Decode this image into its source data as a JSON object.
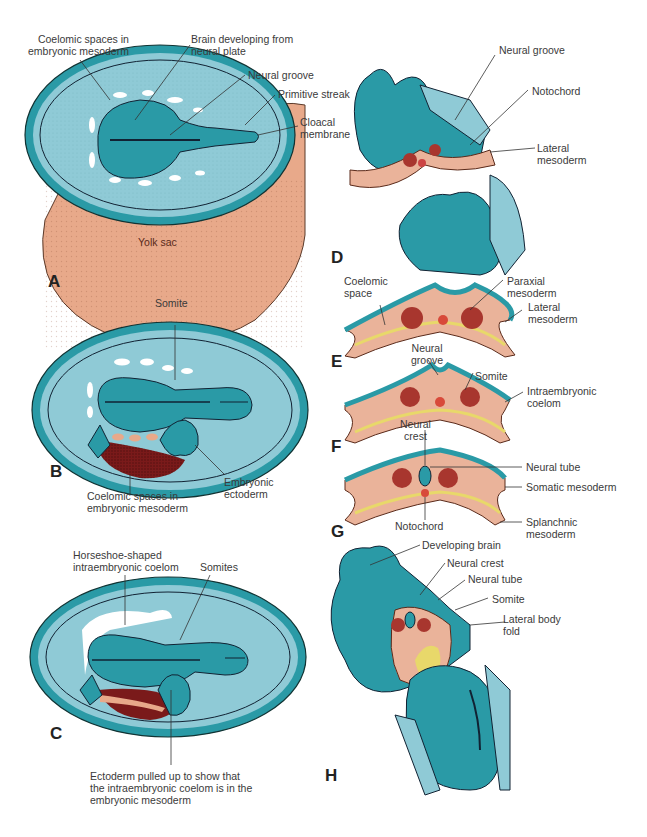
{
  "figure": {
    "colors": {
      "ectoderm_teal": "#2a9aa6",
      "amnion_light_blue": "#8fcad6",
      "yolk_sac_peach": "#e8a98a",
      "mesoderm_pink": "#eab39a",
      "somite_red": "#a8362e",
      "endoderm_yellow": "#e8d86a",
      "dark_maroon": "#6e1a1a"
    },
    "panels": {
      "A": {
        "letter": "A",
        "labels": {
          "coelomic_spaces": "Coelomic spaces in\nembryonic mesoderm",
          "brain": "Brain developing from\nneural plate",
          "neural_groove": "Neural groove",
          "primitive_streak": "Primitive streak",
          "cloacal_membrane": "Cloacal\nmembrane",
          "yolk_sac": "Yolk sac"
        }
      },
      "B": {
        "letter": "B",
        "labels": {
          "somite": "Somite",
          "coelomic_spaces": "Coelomic spaces in\nembryonic mesoderm",
          "embryonic_ectoderm": "Embryonic\nectoderm"
        }
      },
      "C": {
        "letter": "C",
        "labels": {
          "horseshoe": "Horseshoe-shaped\nintraembryonic coelom",
          "somites": "Somites",
          "ectoderm_pulled": "Ectoderm pulled up to show that\nthe intraembryonic coelom is in the\nembryonic mesoderm"
        }
      },
      "D": {
        "letter": "D",
        "labels": {
          "neural_groove": "Neural groove",
          "notochord": "Notochord",
          "lateral_mesoderm": "Lateral\nmesoderm"
        }
      },
      "E": {
        "letter": "E",
        "labels": {
          "coelomic_space": "Coelomic\nspace",
          "paraxial_mesoderm": "Paraxial\nmesoderm",
          "lateral_mesoderm": "Lateral\nmesoderm"
        }
      },
      "F": {
        "letter": "F",
        "labels": {
          "neural_groove": "Neural\ngroove",
          "somite": "Somite",
          "intraembryonic_coelom": "Intraembryonic\ncoelom"
        }
      },
      "G": {
        "letter": "G",
        "labels": {
          "neural_crest": "Neural\ncrest",
          "neural_tube": "Neural tube",
          "somatic_mesoderm": "Somatic mesoderm",
          "notochord": "Notochord",
          "splanchnic_mesoderm": "Splanchnic\nmesoderm"
        }
      },
      "H": {
        "letter": "H",
        "labels": {
          "developing_brain": "Developing brain",
          "neural_crest": "Neural crest",
          "neural_tube": "Neural tube",
          "somite": "Somite",
          "lateral_body_fold": "Lateral body\nfold"
        }
      }
    }
  }
}
